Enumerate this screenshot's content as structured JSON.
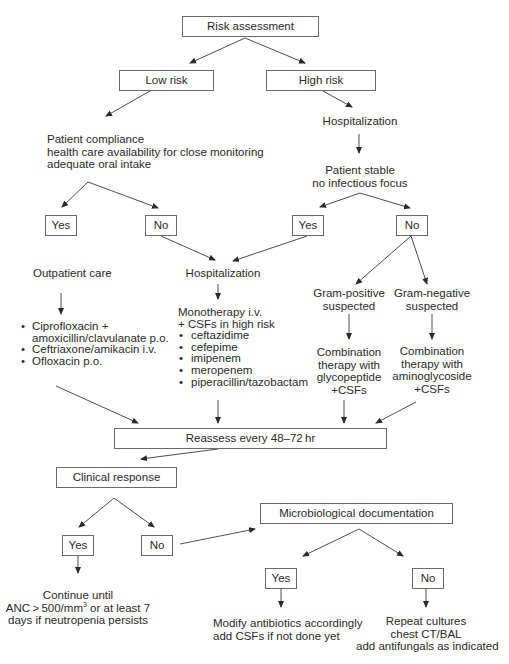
{
  "title": "Risk assessment",
  "risk": {
    "low": "Low risk",
    "high": "High risk"
  },
  "low_branch": {
    "criteria": [
      "Patient compliance",
      "health care availability for close monitoring",
      "adequate oral intake"
    ],
    "yes": "Yes",
    "no": "No",
    "outpatient_label": "Outpatient care",
    "outpatient_regimens": [
      {
        "text": "Ciprofloxacin +",
        "bullet": true
      },
      {
        "text": "amoxicillin/clavulanate p.o.",
        "bullet": false
      },
      {
        "text": "Ceftriaxone/amikacin i.v.",
        "bullet": true
      },
      {
        "text": "Ofloxacin p.o.",
        "bullet": true
      }
    ]
  },
  "high_branch": {
    "hospitalization": "Hospitalization",
    "stable_lines": [
      "Patient stable",
      "no infectious focus"
    ],
    "yes": "Yes",
    "no": "No",
    "gram_positive": [
      "Gram-positive",
      "suspected"
    ],
    "gram_negative": [
      "Gram-negative",
      "suspected"
    ],
    "combo_positive": [
      "Combination",
      "therapy with",
      "glycopeptide",
      "+CSFs"
    ],
    "combo_negative": [
      "Combination",
      "therapy with",
      "aminoglycoside",
      "+CSFs"
    ]
  },
  "hospital_middle": {
    "label": "Hospitalization",
    "monotherapy_lines": [
      "Monotherapy i.v.",
      "+ CSFs in high risk"
    ],
    "drugs": [
      "ceftazidime",
      "cefepime",
      "imipenem",
      "meropenem",
      "piperacillin/tazobactam"
    ]
  },
  "reassess": "Reassess every 48–72 hr",
  "clinical_response": {
    "label": "Clinical response",
    "yes": "Yes",
    "no": "No",
    "continue_line1": "Continue until",
    "continue_line2_pre": "ANC > 500/mm",
    "continue_line2_sup": "3",
    "continue_line2_post": " or at least 7",
    "continue_line3": "days if neutropenia persists"
  },
  "micro": {
    "label": "Microbiological documentation",
    "yes": "Yes",
    "no": "No",
    "yes_action": [
      "Modify antibiotics accordingly",
      "add CSFs if not done yet"
    ],
    "no_action": [
      "Repeat cultures",
      "chest CT/BAL",
      "add antifungals as indicated"
    ]
  },
  "colors": {
    "line": "#3a3a3a",
    "box_border": "#6a6a6a",
    "text": "#2a2a2a",
    "background": "#ffffff"
  }
}
